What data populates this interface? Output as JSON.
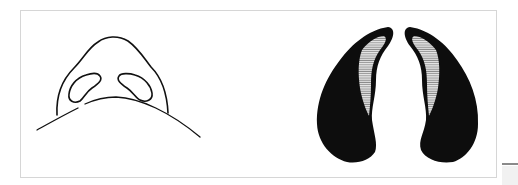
{
  "figure": {
    "panels": [
      {
        "id": "left",
        "label": "nose-basal-outline",
        "style": "line drawing"
      },
      {
        "id": "right",
        "label": "nostril-silhouettes",
        "style": "solid black with hatched inner margin"
      }
    ],
    "colors": {
      "background": "#ffffff",
      "frame": "#d6d6d6",
      "ink": "#111111",
      "hatch": "#9a9a9a"
    }
  }
}
